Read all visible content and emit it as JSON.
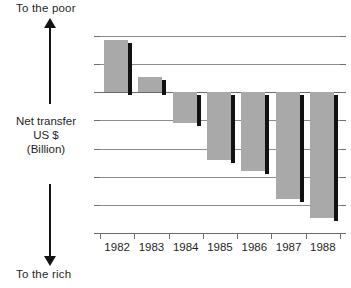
{
  "annotations": {
    "top_label": "To the poor",
    "bottom_label": "To the rich",
    "axis_title_line1": "Net transfer",
    "axis_title_line2": "US $",
    "axis_title_line3": "(Billion)"
  },
  "chart_data": {
    "type": "bar",
    "title": "",
    "subtitle": "",
    "xlabel": "",
    "ylabel": "Net transfer US $ (Billion)",
    "categories": [
      "1982",
      "1983",
      "1984",
      "1985",
      "1986",
      "1987",
      "1988"
    ],
    "values": [
      18.5,
      5.5,
      -11,
      -24,
      -28,
      -38,
      -44.5
    ],
    "ylim": [
      -50,
      20
    ],
    "yticks": [
      20,
      10,
      0,
      -10,
      -20,
      -30,
      -40,
      -50
    ],
    "ytick_labels": [
      "20",
      "10",
      "0",
      "–10",
      "–20",
      "–30",
      "–40",
      "–50"
    ],
    "grid": true,
    "legend": "none",
    "bar_color": "#a9a9a9",
    "bar_shadow_color": "#111111",
    "axis_color": "#6a6a6a",
    "grid_color": "#8d8d8d",
    "text_color": "#1f1f1f",
    "annotations": [
      {
        "text": "To the poor",
        "position": "top-left",
        "arrow": "up"
      },
      {
        "text": "To the rich",
        "position": "bottom-left",
        "arrow": "down"
      }
    ]
  }
}
